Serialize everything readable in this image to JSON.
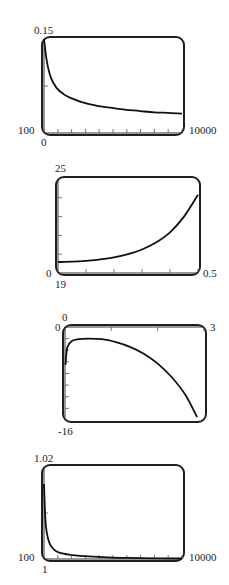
{
  "chart_data": [
    {
      "type": "line",
      "title": "",
      "xlabel": "",
      "ylabel": "",
      "xlim": [
        100,
        10000
      ],
      "ylim": [
        0,
        0.15
      ],
      "labels": {
        "ymax": "0.15",
        "ymin": "0",
        "xmin": "100",
        "xmax": "10000"
      },
      "x_ticks": 10,
      "y_ticks": 2,
      "grid": false,
      "x": [
        100,
        300,
        600,
        1000,
        1500,
        2000,
        3000,
        4000,
        5000,
        6000,
        7000,
        8000,
        9000,
        10000
      ],
      "values": [
        0.15,
        0.115,
        0.088,
        0.072,
        0.062,
        0.056,
        0.048,
        0.043,
        0.04,
        0.037,
        0.035,
        0.033,
        0.032,
        0.031
      ]
    },
    {
      "type": "line",
      "title": "",
      "xlabel": "",
      "ylabel": "",
      "xlim": [
        0,
        0.5
      ],
      "ylim": [
        19,
        25
      ],
      "labels": {
        "ymax": "25",
        "ymin": "19",
        "xmin": "0",
        "xmax": "0.5"
      },
      "x_ticks": 5,
      "y_ticks": 5,
      "grid": false,
      "x": [
        0,
        0.05,
        0.1,
        0.15,
        0.2,
        0.25,
        0.3,
        0.35,
        0.4,
        0.45,
        0.5
      ],
      "values": [
        19.7,
        19.72,
        19.78,
        19.87,
        20.0,
        20.2,
        20.5,
        20.95,
        21.6,
        22.6,
        24.0
      ]
    },
    {
      "type": "line",
      "title": "",
      "xlabel": "",
      "ylabel": "",
      "xlim": [
        0,
        3
      ],
      "ylim": [
        -16,
        0
      ],
      "labels": {
        "ymax": "0",
        "ymin": "-16",
        "xmin": "0",
        "xmax": "3"
      },
      "x_ticks": 3,
      "y_ticks": 8,
      "grid": false,
      "x": [
        0.01,
        0.05,
        0.15,
        0.3,
        0.5,
        0.8,
        1.1,
        1.4,
        1.7,
        2.0,
        2.3,
        2.6,
        2.85
      ],
      "values": [
        -6.5,
        -3.5,
        -2.4,
        -2.1,
        -2.0,
        -2.1,
        -2.6,
        -3.4,
        -4.6,
        -6.3,
        -8.6,
        -11.7,
        -15.5
      ]
    },
    {
      "type": "line",
      "title": "",
      "xlabel": "",
      "ylabel": "",
      "xlim": [
        100,
        10000
      ],
      "ylim": [
        1,
        1.02
      ],
      "labels": {
        "ymax": "1.02",
        "ymin": "1",
        "xmin": "100",
        "xmax": "10000"
      },
      "x_ticks": 10,
      "y_ticks": 2,
      "grid": false,
      "x": [
        100,
        200,
        300,
        500,
        800,
        1200,
        2000,
        3000,
        5000,
        7000,
        10000
      ],
      "values": [
        1.0163,
        1.0085,
        1.0057,
        1.0034,
        1.0021,
        1.0014,
        1.0009,
        1.0006,
        1.0003,
        1.0002,
        1.0001
      ]
    }
  ]
}
